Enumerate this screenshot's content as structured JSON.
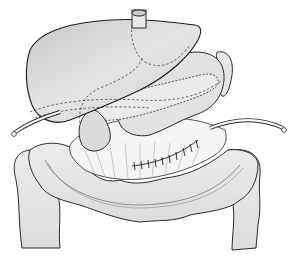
{
  "illustration": {
    "subject": "Surgical anatomy illustration of upper abdomen",
    "structures": [
      "liver",
      "stomach",
      "pancreas",
      "spleen",
      "transverse colon",
      "ascending colon",
      "descending colon",
      "drain tube",
      "suture line"
    ],
    "colors": {
      "background": "#ffffff",
      "stroke": "#2a2a2a",
      "organ_fill": "#d9d9d9",
      "organ_light": "#ececec"
    }
  }
}
